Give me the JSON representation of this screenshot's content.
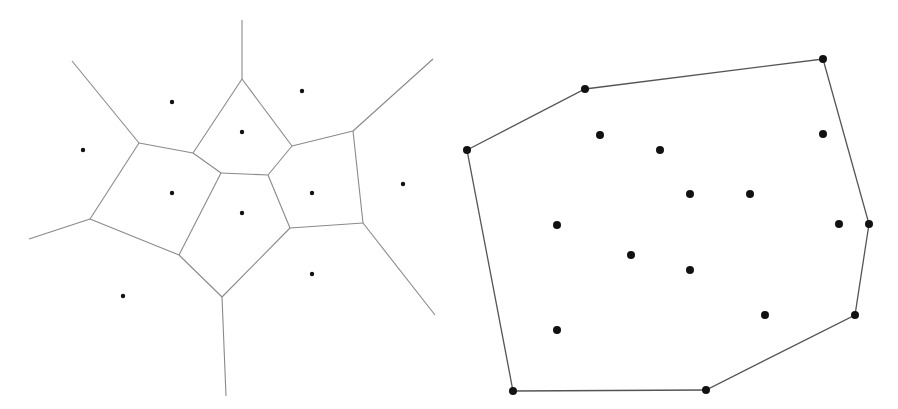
{
  "diagrams": [
    {
      "name": "voronoi-diagram",
      "line_color": "#8a8a8a",
      "point_color": "#111111",
      "edges": [
        [
          [
            242,
            20
          ],
          [
            242,
            79
          ]
        ],
        [
          [
            72,
            61
          ],
          [
            139,
            143
          ]
        ],
        [
          [
            139,
            143
          ],
          [
            193,
            153
          ]
        ],
        [
          [
            193,
            153
          ],
          [
            242,
            79
          ]
        ],
        [
          [
            242,
            79
          ],
          [
            292,
            146
          ]
        ],
        [
          [
            292,
            146
          ],
          [
            353,
            131
          ]
        ],
        [
          [
            353,
            131
          ],
          [
            433,
            59
          ]
        ],
        [
          [
            193,
            153
          ],
          [
            221,
            173
          ]
        ],
        [
          [
            221,
            173
          ],
          [
            268,
            175
          ]
        ],
        [
          [
            268,
            175
          ],
          [
            292,
            146
          ]
        ],
        [
          [
            353,
            131
          ],
          [
            363,
            223
          ]
        ],
        [
          [
            139,
            143
          ],
          [
            90,
            219
          ]
        ],
        [
          [
            90,
            219
          ],
          [
            29,
            239
          ]
        ],
        [
          [
            90,
            219
          ],
          [
            179,
            255
          ]
        ],
        [
          [
            179,
            255
          ],
          [
            221,
            173
          ]
        ],
        [
          [
            179,
            255
          ],
          [
            222,
            297
          ]
        ],
        [
          [
            222,
            297
          ],
          [
            226,
            396
          ]
        ],
        [
          [
            222,
            297
          ],
          [
            290,
            228
          ]
        ],
        [
          [
            290,
            228
          ],
          [
            268,
            175
          ]
        ],
        [
          [
            290,
            228
          ],
          [
            363,
            223
          ]
        ],
        [
          [
            363,
            223
          ],
          [
            435,
            315
          ]
        ]
      ],
      "sites": [
        [
          83,
          150
        ],
        [
          172,
          102
        ],
        [
          242,
          132
        ],
        [
          302,
          91
        ],
        [
          172,
          193
        ],
        [
          242,
          213
        ],
        [
          312,
          193
        ],
        [
          403,
          184
        ],
        [
          312,
          274
        ],
        [
          123,
          296
        ]
      ]
    },
    {
      "name": "convex-hull-diagram",
      "line_color": "#555555",
      "point_color": "#111111",
      "hull": [
        [
          467,
          150
        ],
        [
          585,
          89
        ],
        [
          823,
          59
        ],
        [
          869,
          224
        ],
        [
          855,
          315
        ],
        [
          706,
          390
        ],
        [
          513,
          391
        ]
      ],
      "interior_points": [
        [
          600,
          135
        ],
        [
          660,
          150
        ],
        [
          823,
          134
        ],
        [
          690,
          194
        ],
        [
          750,
          194
        ],
        [
          557,
          225
        ],
        [
          839,
          224
        ],
        [
          631,
          255
        ],
        [
          690,
          270
        ],
        [
          765,
          315
        ],
        [
          557,
          330
        ]
      ]
    }
  ]
}
